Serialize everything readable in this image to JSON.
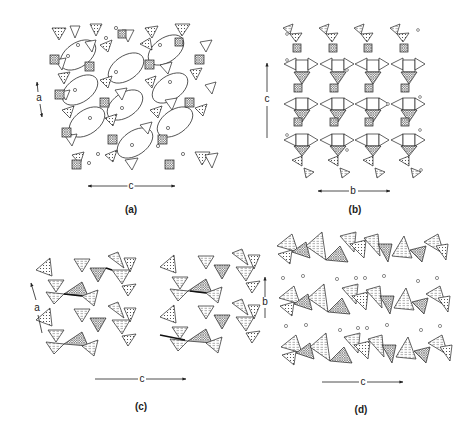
{
  "figure": {
    "panels": [
      {
        "id": "a",
        "caption": "(a)",
        "axes": [
          {
            "label": "a",
            "direction": "vertical-double"
          },
          {
            "label": "c",
            "direction": "horizontal-double"
          }
        ],
        "description": "Framework of tetrahedra and octahedra with large elliptical channels containing cations"
      },
      {
        "id": "b",
        "caption": "(b)",
        "axes": [
          {
            "label": "c",
            "direction": "vertical-up"
          },
          {
            "label": "b",
            "direction": "horizontal-double"
          }
        ],
        "description": "Four vertical zig-zag chains of polyhedra along c"
      },
      {
        "id": "c",
        "caption": "(c)",
        "axes": [
          {
            "label": "a",
            "direction": "vertical-up-tilted"
          },
          {
            "label": "c",
            "direction": "horizontal-right"
          }
        ],
        "description": "Two corrugated chains of corner-sharing tetrahedra and octahedra"
      },
      {
        "id": "d",
        "caption": "(d)",
        "axes": [
          {
            "label": "b",
            "direction": "vertical-up"
          },
          {
            "label": "c",
            "direction": "horizontal-right"
          }
        ],
        "description": "Three horizontal polyhedral layers separated by rows of interlayer cations"
      }
    ],
    "colors": {
      "line": "#222222",
      "background": "#ffffff",
      "fill_light": "#ffffff"
    }
  }
}
